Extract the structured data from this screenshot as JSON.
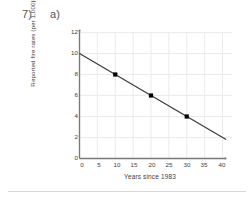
{
  "problem": {
    "number_label": "7)",
    "part_label": "a)"
  },
  "chart_data": {
    "type": "scatter",
    "title": "",
    "xlabel": "Years since 1983",
    "ylabel": "Reported fire rates (per 1,000)",
    "xlim": [
      0,
      42
    ],
    "ylim": [
      0,
      12
    ],
    "xticks": [
      0,
      5,
      10,
      15,
      20,
      25,
      30,
      35,
      40
    ],
    "yticks": [
      0,
      2,
      4,
      6,
      8,
      10,
      12
    ],
    "xtick_labels": [
      "0",
      "5",
      "10",
      "15",
      "20",
      "25",
      "30",
      "35",
      "40"
    ],
    "ytick_labels": [
      "0",
      "2",
      "4",
      "6",
      "8",
      "10",
      "12"
    ],
    "grid": true,
    "grid_color": "#ebebeb",
    "legend": null,
    "axis_color": "#7a7a7a",
    "marker_color": "#000000",
    "line_color": "#3a3a3a",
    "points": [
      {
        "x": 10,
        "y": 8
      },
      {
        "x": 20,
        "y": 6
      },
      {
        "x": 30,
        "y": 4
      }
    ],
    "trendline": {
      "label": "fitted line",
      "intercept": 10,
      "slope": -0.2,
      "x_start": 0,
      "y_start": 10,
      "x_end": 41,
      "y_end": 1.8
    }
  }
}
